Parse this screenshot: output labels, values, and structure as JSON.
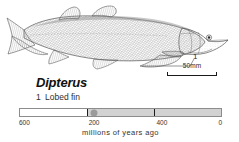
{
  "figure": {
    "specimen_name": "Dipterus",
    "illustration_alt": "lateral line drawing of the lobe-finned fish Dipterus, head to the right",
    "callouts": [
      {
        "number": "1",
        "label": "Lobed fin"
      }
    ],
    "scale": {
      "label": "50mm"
    }
  },
  "chart_data": {
    "type": "bar",
    "title": "",
    "xlabel": "millions of years ago",
    "ylabel": "",
    "categories": [
      "600",
      "400",
      "200",
      "0"
    ],
    "tick_values": [
      600,
      400,
      200,
      0
    ],
    "tick_labels": [
      "600",
      "400",
      "200",
      "0"
    ],
    "xlim": [
      600,
      0
    ],
    "grid": false,
    "legend": "none",
    "series": [
      {
        "name": "shaded span",
        "from": 400,
        "to": 0
      }
    ],
    "markers": [
      {
        "name": "Dipterus occurrence",
        "value": 380
      }
    ],
    "values": [
      600,
      400,
      200,
      0
    ]
  },
  "colors": {
    "ink": "#1a1a1a",
    "timeline_fill": "#d2d2d2",
    "timeline_border": "#8c8c8c",
    "marker": "#9a9a9a",
    "background": "#ffffff"
  }
}
